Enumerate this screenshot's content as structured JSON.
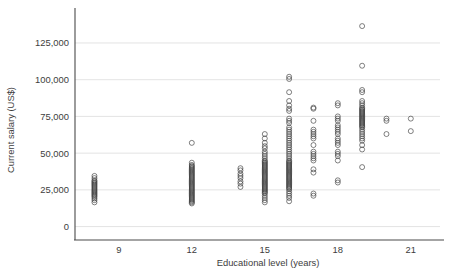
{
  "chart_data": {
    "type": "scatter",
    "title": "",
    "xlabel": "Educational level (years)",
    "ylabel": "Current salary (US$)",
    "xlim": [
      7.2,
      22.2
    ],
    "ylim": [
      -3000,
      142000
    ],
    "xticks": [
      9,
      12,
      15,
      18,
      21
    ],
    "xtick_labels": [
      "9",
      "12",
      "15",
      "18",
      "21"
    ],
    "yticks": [
      0,
      25000,
      50000,
      75000,
      100000,
      125000
    ],
    "ytick_labels": [
      "0",
      "25,000",
      "50,000",
      "75,000",
      "100,000",
      "125,000"
    ],
    "grid": "horizontal",
    "legend": "none",
    "marker": "open-circle",
    "marker_color": "#3a3a3a",
    "grid_color": "#dcdcdc",
    "axis_color": "#4a4a4a",
    "text_color": "#3d3d3d",
    "background": "#ffffff",
    "series": [
      {
        "name": "Employees",
        "points": [
          [
            8,
            16500
          ],
          [
            8,
            18000
          ],
          [
            8,
            19200
          ],
          [
            8,
            20250
          ],
          [
            8,
            21000
          ],
          [
            8,
            21750
          ],
          [
            8,
            22500
          ],
          [
            8,
            23250
          ],
          [
            8,
            24000
          ],
          [
            8,
            24750
          ],
          [
            8,
            25500
          ],
          [
            8,
            26250
          ],
          [
            8,
            27000
          ],
          [
            8,
            27750
          ],
          [
            8,
            28500
          ],
          [
            8,
            29250
          ],
          [
            8,
            30000
          ],
          [
            8,
            30750
          ],
          [
            8,
            31500
          ],
          [
            8,
            33000
          ],
          [
            8,
            34500
          ],
          [
            12,
            15750
          ],
          [
            12,
            16500
          ],
          [
            12,
            17250
          ],
          [
            12,
            18000
          ],
          [
            12,
            18750
          ],
          [
            12,
            19500
          ],
          [
            12,
            20250
          ],
          [
            12,
            21000
          ],
          [
            12,
            21750
          ],
          [
            12,
            22500
          ],
          [
            12,
            23250
          ],
          [
            12,
            24000
          ],
          [
            12,
            24750
          ],
          [
            12,
            25500
          ],
          [
            12,
            26250
          ],
          [
            12,
            27000
          ],
          [
            12,
            27750
          ],
          [
            12,
            28500
          ],
          [
            12,
            29250
          ],
          [
            12,
            30000
          ],
          [
            12,
            30750
          ],
          [
            12,
            31500
          ],
          [
            12,
            32250
          ],
          [
            12,
            33000
          ],
          [
            12,
            33750
          ],
          [
            12,
            34500
          ],
          [
            12,
            35250
          ],
          [
            12,
            36000
          ],
          [
            12,
            36750
          ],
          [
            12,
            37500
          ],
          [
            12,
            38250
          ],
          [
            12,
            39000
          ],
          [
            12,
            39750
          ],
          [
            12,
            40500
          ],
          [
            12,
            41250
          ],
          [
            12,
            42000
          ],
          [
            12,
            43500
          ],
          [
            12,
            57000
          ],
          [
            14,
            27000
          ],
          [
            14,
            29250
          ],
          [
            14,
            30750
          ],
          [
            14,
            33000
          ],
          [
            14,
            34500
          ],
          [
            14,
            36000
          ],
          [
            14,
            38250
          ],
          [
            14,
            39750
          ],
          [
            15,
            16500
          ],
          [
            15,
            18000
          ],
          [
            15,
            19500
          ],
          [
            15,
            21000
          ],
          [
            15,
            22500
          ],
          [
            15,
            23250
          ],
          [
            15,
            24000
          ],
          [
            15,
            24750
          ],
          [
            15,
            25500
          ],
          [
            15,
            26250
          ],
          [
            15,
            27000
          ],
          [
            15,
            27750
          ],
          [
            15,
            28500
          ],
          [
            15,
            29250
          ],
          [
            15,
            30000
          ],
          [
            15,
            30750
          ],
          [
            15,
            31500
          ],
          [
            15,
            32250
          ],
          [
            15,
            33000
          ],
          [
            15,
            33750
          ],
          [
            15,
            34500
          ],
          [
            15,
            35250
          ],
          [
            15,
            36000
          ],
          [
            15,
            36750
          ],
          [
            15,
            37500
          ],
          [
            15,
            38250
          ],
          [
            15,
            39000
          ],
          [
            15,
            39750
          ],
          [
            15,
            40500
          ],
          [
            15,
            41250
          ],
          [
            15,
            42000
          ],
          [
            15,
            42750
          ],
          [
            15,
            43500
          ],
          [
            15,
            44250
          ],
          [
            15,
            45000
          ],
          [
            15,
            46500
          ],
          [
            15,
            48000
          ],
          [
            15,
            49500
          ],
          [
            15,
            51000
          ],
          [
            15,
            53250
          ],
          [
            15,
            54750
          ],
          [
            15,
            57000
          ],
          [
            15,
            60000
          ],
          [
            15,
            63000
          ],
          [
            16,
            17250
          ],
          [
            16,
            19500
          ],
          [
            16,
            21000
          ],
          [
            16,
            22500
          ],
          [
            16,
            24000
          ],
          [
            16,
            25500
          ],
          [
            16,
            26250
          ],
          [
            16,
            27000
          ],
          [
            16,
            27750
          ],
          [
            16,
            28500
          ],
          [
            16,
            29250
          ],
          [
            16,
            30000
          ],
          [
            16,
            30750
          ],
          [
            16,
            31500
          ],
          [
            16,
            32250
          ],
          [
            16,
            33000
          ],
          [
            16,
            33750
          ],
          [
            16,
            34500
          ],
          [
            16,
            35250
          ],
          [
            16,
            36000
          ],
          [
            16,
            36750
          ],
          [
            16,
            37500
          ],
          [
            16,
            38250
          ],
          [
            16,
            39000
          ],
          [
            16,
            39750
          ],
          [
            16,
            40500
          ],
          [
            16,
            41250
          ],
          [
            16,
            42000
          ],
          [
            16,
            42750
          ],
          [
            16,
            43500
          ],
          [
            16,
            44250
          ],
          [
            16,
            45000
          ],
          [
            16,
            46500
          ],
          [
            16,
            48000
          ],
          [
            16,
            49500
          ],
          [
            16,
            51000
          ],
          [
            16,
            52500
          ],
          [
            16,
            54000
          ],
          [
            16,
            55500
          ],
          [
            16,
            57000
          ],
          [
            16,
            58500
          ],
          [
            16,
            60000
          ],
          [
            16,
            61500
          ],
          [
            16,
            63000
          ],
          [
            16,
            64500
          ],
          [
            16,
            66000
          ],
          [
            16,
            67500
          ],
          [
            16,
            70500
          ],
          [
            16,
            72000
          ],
          [
            16,
            73500
          ],
          [
            16,
            78750
          ],
          [
            16,
            80250
          ],
          [
            16,
            82500
          ],
          [
            16,
            85500
          ],
          [
            16,
            91500
          ],
          [
            16,
            100500
          ],
          [
            16,
            102000
          ],
          [
            17,
            21000
          ],
          [
            17,
            22500
          ],
          [
            17,
            36750
          ],
          [
            17,
            39000
          ],
          [
            17,
            45000
          ],
          [
            17,
            46500
          ],
          [
            17,
            48000
          ],
          [
            17,
            49500
          ],
          [
            17,
            51000
          ],
          [
            17,
            55500
          ],
          [
            17,
            60000
          ],
          [
            17,
            61500
          ],
          [
            17,
            63000
          ],
          [
            17,
            64500
          ],
          [
            17,
            66000
          ],
          [
            17,
            72000
          ],
          [
            17,
            80250
          ],
          [
            17,
            81000
          ],
          [
            18,
            30000
          ],
          [
            18,
            31500
          ],
          [
            18,
            45000
          ],
          [
            18,
            48000
          ],
          [
            18,
            49500
          ],
          [
            18,
            51000
          ],
          [
            18,
            55500
          ],
          [
            18,
            57000
          ],
          [
            18,
            58500
          ],
          [
            18,
            60000
          ],
          [
            18,
            63000
          ],
          [
            18,
            64500
          ],
          [
            18,
            66000
          ],
          [
            18,
            67500
          ],
          [
            18,
            69000
          ],
          [
            18,
            72000
          ],
          [
            18,
            73500
          ],
          [
            18,
            75000
          ],
          [
            18,
            82500
          ],
          [
            18,
            84000
          ],
          [
            19,
            40500
          ],
          [
            19,
            52500
          ],
          [
            19,
            55500
          ],
          [
            19,
            58500
          ],
          [
            19,
            60000
          ],
          [
            19,
            61500
          ],
          [
            19,
            63000
          ],
          [
            19,
            64500
          ],
          [
            19,
            66000
          ],
          [
            19,
            67500
          ],
          [
            19,
            68250
          ],
          [
            19,
            69000
          ],
          [
            19,
            69750
          ],
          [
            19,
            70500
          ],
          [
            19,
            71250
          ],
          [
            19,
            72000
          ],
          [
            19,
            72750
          ],
          [
            19,
            73500
          ],
          [
            19,
            74250
          ],
          [
            19,
            75000
          ],
          [
            19,
            75750
          ],
          [
            19,
            76500
          ],
          [
            19,
            77250
          ],
          [
            19,
            78000
          ],
          [
            19,
            78750
          ],
          [
            19,
            79500
          ],
          [
            19,
            80250
          ],
          [
            19,
            81000
          ],
          [
            19,
            82500
          ],
          [
            19,
            84000
          ],
          [
            19,
            85500
          ],
          [
            19,
            91500
          ],
          [
            19,
            93000
          ],
          [
            19,
            109500
          ],
          [
            19,
            136500
          ],
          [
            20,
            63000
          ],
          [
            20,
            72000
          ],
          [
            20,
            73500
          ],
          [
            21,
            65000
          ],
          [
            21,
            73500
          ]
        ]
      }
    ]
  }
}
